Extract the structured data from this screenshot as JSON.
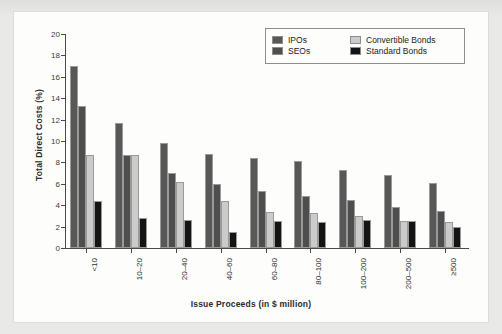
{
  "chart_data": {
    "type": "bar",
    "title": "",
    "xlabel": "Issue Proceeds (in $ million)",
    "ylabel": "Total Direct Costs (%)",
    "ylim": [
      0,
      20
    ],
    "yticks": [
      0,
      2,
      4,
      6,
      8,
      10,
      12,
      14,
      16,
      18,
      20
    ],
    "ytick_labels": [
      "0",
      "2",
      "4",
      "6",
      "8",
      "10",
      "12",
      "14",
      "16",
      "18",
      "20"
    ],
    "grid": false,
    "legend_position": "top-right",
    "categories": [
      "<10",
      "10–20",
      "20–40",
      "40–60",
      "60–80",
      "80–100",
      "100–200",
      "200–500",
      "≥500"
    ],
    "series": [
      {
        "name": "IPOs",
        "color": "#585858",
        "values": [
          17.0,
          11.7,
          9.8,
          8.8,
          8.4,
          8.1,
          7.3,
          6.8,
          6.1
        ]
      },
      {
        "name": "SEOs",
        "color": "#4e4e4e",
        "values": [
          13.3,
          8.7,
          7.0,
          6.0,
          5.3,
          4.9,
          4.5,
          3.8,
          3.5
        ]
      },
      {
        "name": "Convertible Bonds",
        "color": "#cbcbcb",
        "values": [
          8.7,
          8.7,
          6.2,
          4.4,
          3.4,
          3.3,
          3.0,
          2.5,
          2.4
        ]
      },
      {
        "name": "Standard Bonds",
        "color": "#141414",
        "values": [
          4.4,
          2.8,
          2.6,
          1.5,
          2.5,
          2.4,
          2.6,
          2.5,
          2.0
        ]
      }
    ]
  },
  "legend": {
    "items": [
      {
        "label": "IPOs"
      },
      {
        "label": "Convertible Bonds"
      },
      {
        "label": "SEOs"
      },
      {
        "label": "Standard Bonds"
      }
    ]
  }
}
